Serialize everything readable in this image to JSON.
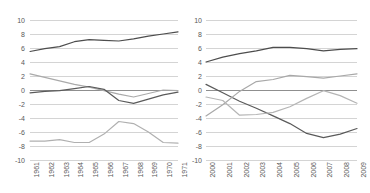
{
  "chart_data": [
    {
      "type": "line",
      "title": "",
      "xlabel": "",
      "ylabel": "",
      "ylim": [
        -10,
        10
      ],
      "ytick_step": 2,
      "yticks": [
        10,
        8,
        6,
        4,
        2,
        0,
        -2,
        -4,
        -6,
        -8,
        -10
      ],
      "grid": true,
      "legend": "none",
      "categories": [
        "1961",
        "1962",
        "1963",
        "1964",
        "1965",
        "1966",
        "1967",
        "1968",
        "1969",
        "1970",
        "1971"
      ],
      "series": [
        {
          "name": "series-1-dark-upper",
          "color": "#4d4d4d",
          "values": [
            5.5,
            5.9,
            6.2,
            6.9,
            7.2,
            7.1,
            7.0,
            7.3,
            7.7,
            8.0,
            8.3
          ]
        },
        {
          "name": "series-2-light-descending",
          "color": "#aaaaaa",
          "values": [
            2.3,
            1.8,
            1.3,
            0.8,
            0.4,
            -0.1,
            -0.6,
            -1.0,
            -0.5,
            0.0,
            -0.1
          ]
        },
        {
          "name": "series-3-dark-lower",
          "color": "#5a5a5a",
          "values": [
            -0.4,
            -0.2,
            -0.1,
            0.2,
            0.5,
            0.1,
            -1.5,
            -1.9,
            -1.3,
            -0.7,
            -0.3
          ]
        },
        {
          "name": "series-4-light-bottom",
          "color": "#b0b0b0",
          "values": [
            -7.3,
            -7.3,
            -7.1,
            -7.5,
            -7.5,
            -6.3,
            -4.5,
            -4.8,
            -6.0,
            -7.5,
            -7.6
          ]
        }
      ]
    },
    {
      "type": "line",
      "title": "",
      "xlabel": "",
      "ylabel": "",
      "ylim": [
        -10,
        10
      ],
      "ytick_step": 2,
      "yticks": [
        10,
        8,
        6,
        4,
        2,
        0,
        -2,
        -4,
        -6,
        -8,
        -10
      ],
      "grid": true,
      "legend": "none",
      "categories": [
        "2000",
        "2001",
        "2002",
        "2003",
        "2004",
        "2005",
        "2006",
        "2007",
        "2008",
        "2009"
      ],
      "series": [
        {
          "name": "series-1-dark-upper",
          "color": "#4d4d4d",
          "values": [
            4.0,
            4.7,
            5.2,
            5.6,
            6.1,
            6.1,
            5.9,
            5.6,
            5.8,
            5.9
          ]
        },
        {
          "name": "series-2-dark-descending",
          "color": "#5a5a5a",
          "values": [
            0.8,
            -0.4,
            -1.6,
            -2.6,
            -3.7,
            -4.8,
            -6.2,
            -6.8,
            -6.3,
            -5.5
          ]
        },
        {
          "name": "series-3-light-rising",
          "color": "#a8a8a8",
          "values": [
            -3.7,
            -2.1,
            -0.2,
            1.2,
            1.5,
            2.1,
            1.9,
            1.7,
            2.0,
            2.3
          ]
        },
        {
          "name": "series-4-light-dipping",
          "color": "#b5b5b5",
          "values": [
            -1.0,
            -1.5,
            -3.6,
            -3.5,
            -3.2,
            -2.4,
            -1.2,
            -0.1,
            -0.8,
            -1.9
          ]
        }
      ]
    }
  ]
}
